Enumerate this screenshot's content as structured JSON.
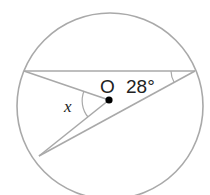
{
  "diagram": {
    "type": "circle-geometry",
    "center_label": "O",
    "angle_given": "28°",
    "angle_unknown": "x",
    "colors": {
      "line": "#a9a9a9",
      "text": "#222222",
      "center_dot": "#000000"
    },
    "circle": {
      "cx": 110,
      "cy": 106,
      "r": 93
    },
    "points": {
      "A": [
        24,
        71
      ],
      "B": [
        195,
        71
      ],
      "C": [
        39,
        156
      ],
      "O": [
        109,
        100
      ]
    }
  }
}
